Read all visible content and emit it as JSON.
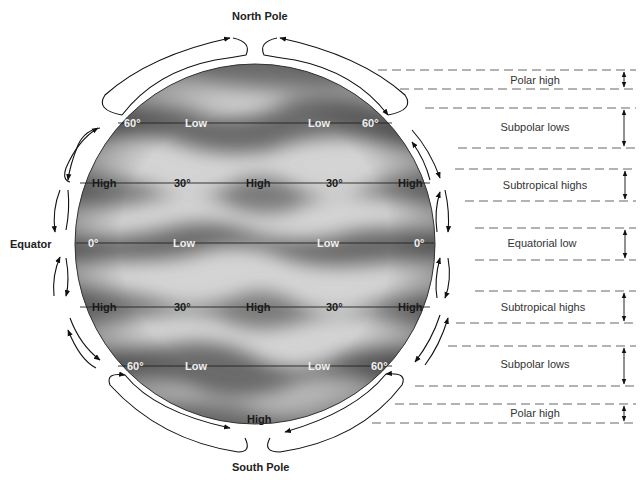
{
  "diagram": {
    "poles": {
      "north": "North Pole",
      "south": "South Pole"
    },
    "equator_label": "Equator",
    "latitude_lines": [
      {
        "id": "60n",
        "degree": "60°",
        "labels": [
          "Low",
          "Low"
        ],
        "tone": "light"
      },
      {
        "id": "30n",
        "degree": "30°",
        "labels": [
          "High",
          "High",
          "High"
        ],
        "tone": "dark"
      },
      {
        "id": "0",
        "degree": "0°",
        "labels": [
          "Low",
          "Low"
        ],
        "tone": "light"
      },
      {
        "id": "30s",
        "degree": "30°",
        "labels": [
          "High",
          "High",
          "High"
        ],
        "tone": "dark"
      },
      {
        "id": "60s",
        "degree": "60°",
        "labels": [
          "Low",
          "Low"
        ],
        "tone": "light"
      }
    ],
    "south_pole_high": "High",
    "zones": [
      {
        "name": "Polar high"
      },
      {
        "name": "Subpolar lows"
      },
      {
        "name": "Subtropical highs"
      },
      {
        "name": "Equatorial low"
      },
      {
        "name": "Subtropical highs"
      },
      {
        "name": "Subpolar lows"
      },
      {
        "name": "Polar high"
      }
    ],
    "colors": {
      "sphere_light": "#d6d6d6",
      "sphere_dark": "#6e6e6e",
      "line": "#222222",
      "dash": "#555555"
    }
  }
}
